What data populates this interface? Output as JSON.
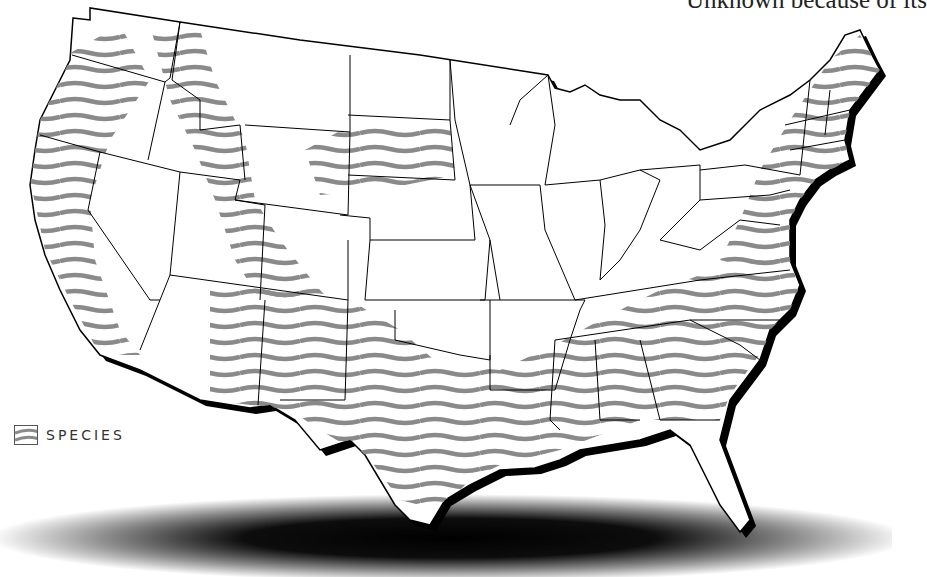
{
  "caption": {
    "text": "Unknown because of its"
  },
  "map": {
    "title": "Contiguous United States species range map",
    "fill_color": "#ffffff",
    "outline_color": "#000000",
    "range_stripe_color": "#8a8a8a",
    "shadow_color": "#000000",
    "ranges": [
      {
        "name": "Pacific coast band",
        "states": [
          "Washington",
          "Oregon",
          "California"
        ]
      },
      {
        "name": "Rocky Mountain band",
        "states": [
          "Washington",
          "Idaho",
          "Montana",
          "Wyoming",
          "Utah",
          "Colorado"
        ]
      },
      {
        "name": "Northern plains patch",
        "states": [
          "Wyoming",
          "South Dakota",
          "Nebraska"
        ]
      },
      {
        "name": "Southwest and southern band",
        "states": [
          "Arizona",
          "New Mexico",
          "Texas",
          "Oklahoma",
          "Louisiana",
          "Mississippi",
          "Alabama",
          "Georgia",
          "South Carolina",
          "North Carolina",
          "Tennessee"
        ]
      },
      {
        "name": "Atlantic coast band",
        "states": [
          "Virginia",
          "Maryland",
          "Pennsylvania",
          "New York",
          "Massachusetts",
          "Vermont",
          "New Hampshire",
          "Maine"
        ]
      }
    ]
  },
  "legend": {
    "label": "SPECIES",
    "swatch_icon": "striped-swatch-icon"
  }
}
